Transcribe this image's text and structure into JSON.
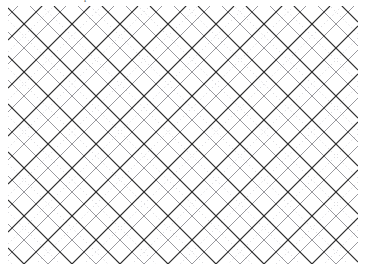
{
  "figure": {
    "width": 366,
    "height": 274,
    "background_color": "#ffffff",
    "clipped_top_glyph": "p"
  },
  "chart_data": {
    "type": "diagram",
    "subtype": "geometric-lattice-tiling",
    "plot_area": {
      "x": 8,
      "y": 6,
      "width": 350,
      "height": 258
    },
    "grid": {
      "angle_degrees": 45,
      "diamond_period_px": 48,
      "diagonal_spacing_px": 33.94,
      "origin_offset_x": 8,
      "origin_offset_y": 6
    },
    "line_families": [
      {
        "name": "dark-diamond-lines",
        "style": "solid",
        "color": "#2b2b2b",
        "width_px": 1.1,
        "direction": "both",
        "spacing_px": 48,
        "phase_offset_px": 0,
        "role": "primary diamond outlines"
      },
      {
        "name": "medium-gray-diagonals",
        "style": "solid",
        "color": "#8d8d93",
        "width_px": 0.9,
        "direction": "both",
        "spacing_px": 48,
        "phase_offset_px": 24,
        "role": "secondary crossing diagonals"
      },
      {
        "name": "light-dotted-diagonals",
        "style": "dotted",
        "color": "#c2c2c8",
        "width_px": 0.9,
        "dash_pattern": "0.9 3.2",
        "direction": "both",
        "spacing_px": 48,
        "phase_offset_px": 12,
        "role": "faint dotted lattice"
      }
    ],
    "legend": {
      "visible": false
    },
    "axes": {
      "visible": false
    },
    "gridlines": {
      "visible": false
    },
    "labels": []
  }
}
